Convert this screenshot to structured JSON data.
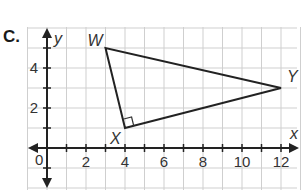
{
  "problem": {
    "label": "C."
  },
  "axes": {
    "x_label": "x",
    "y_label": "y",
    "origin_label": "0",
    "x_ticks": [
      "2",
      "4",
      "6",
      "8",
      "10",
      "12"
    ],
    "y_ticks": [
      "2",
      "4"
    ],
    "xlim": [
      -1,
      13
    ],
    "ylim": [
      -2,
      6
    ]
  },
  "triangle": {
    "vertices": [
      {
        "name": "W",
        "x": 3,
        "y": 5
      },
      {
        "name": "X",
        "x": 4,
        "y": 1
      },
      {
        "name": "Y",
        "x": 12,
        "y": 3
      }
    ],
    "right_angle_at": "X"
  },
  "colors": {
    "grid": "#cfcfcf",
    "ink": "#222222"
  }
}
